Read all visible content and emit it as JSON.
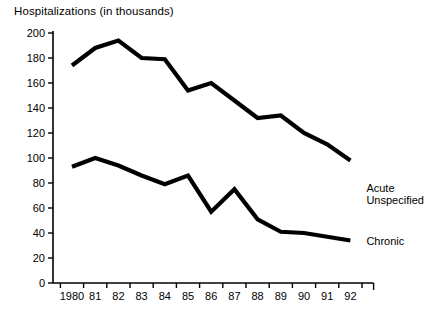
{
  "chart_data": {
    "type": "line",
    "title": "Hospitalizations (in thousands)",
    "xlabel": "",
    "ylabel": "",
    "ylim": [
      0,
      200
    ],
    "ytick_step": 20,
    "yticks": [
      "0",
      "20",
      "40",
      "60",
      "80",
      "100",
      "120",
      "140",
      "160",
      "180",
      "200"
    ],
    "grid": false,
    "legend_position": "right-inline-labels",
    "categories": [
      "1980",
      "81",
      "82",
      "83",
      "84",
      "85",
      "86",
      "87",
      "88",
      "89",
      "90",
      "91",
      "92"
    ],
    "x_values": [
      1980,
      1981,
      1982,
      1983,
      1984,
      1985,
      1986,
      1987,
      1988,
      1989,
      1990,
      1991,
      1992
    ],
    "series": [
      {
        "name": "Acute Unspecified",
        "label_line1": "Acute",
        "label_line2": "Unspecified",
        "color": "#000000",
        "values": [
          174,
          188,
          194,
          180,
          179,
          154,
          160,
          146,
          132,
          134,
          120,
          111,
          98
        ]
      },
      {
        "name": "Chronic",
        "label_line1": "Chronic",
        "label_line2": "",
        "color": "#000000",
        "values": [
          93,
          100,
          94,
          86,
          79,
          86,
          57,
          75,
          51,
          41,
          40,
          37,
          34
        ]
      }
    ]
  },
  "chart": {
    "title": "Hospitalizations (in thousands)",
    "background_color": "#ffffff",
    "axis_color": "#000000",
    "line_color": "#000000"
  }
}
